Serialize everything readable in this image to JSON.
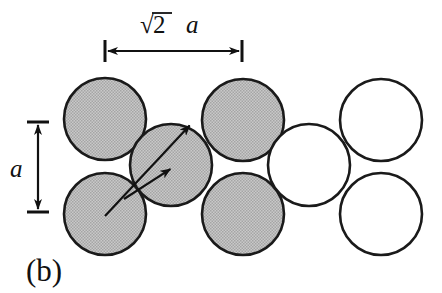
{
  "figure": {
    "panel_label": "(b)",
    "width": 442,
    "height": 293,
    "background_color": "#ffffff",
    "line_color": "#1a1a1a",
    "shaded_fill_color": "#b9b9b9",
    "open_fill_color": "#ffffff"
  },
  "annotations": {
    "horizontal_dimension": {
      "radical_symbol": "√",
      "radicand": "2",
      "variable": "a",
      "full_label": "√2 a",
      "x_start": 105,
      "x_end": 242,
      "y": 51
    },
    "vertical_dimension": {
      "label": "a",
      "y_start": 122,
      "y_end": 212,
      "x": 38
    }
  },
  "chart_data": {
    "type": "scatter",
    "title": "(b)",
    "xlabel": "",
    "ylabel": "",
    "sphere_radius": 41,
    "row_spacing": 95,
    "column_spacing": 138,
    "legend": [
      {
        "name": "shaded-sphere",
        "fill": "#b9b9b9"
      },
      {
        "name": "open-sphere",
        "fill": "#ffffff"
      }
    ],
    "spheres": [
      {
        "id": "top-left-shaded",
        "cx": 105,
        "cy": 119,
        "r": 41,
        "style": "shaded",
        "row": "top",
        "column": 1
      },
      {
        "id": "bottom-left-shaded",
        "cx": 105,
        "cy": 214,
        "r": 41,
        "style": "shaded",
        "row": "bottom",
        "column": 1
      },
      {
        "id": "middle-stagger-shaded",
        "cx": 171,
        "cy": 165,
        "r": 41,
        "style": "shaded",
        "row": "middle",
        "column": 2
      },
      {
        "id": "top-mid-shaded",
        "cx": 243,
        "cy": 120,
        "r": 41,
        "style": "shaded",
        "row": "top",
        "column": 3
      },
      {
        "id": "bottom-mid-shaded",
        "cx": 243,
        "cy": 214,
        "r": 41,
        "style": "shaded",
        "row": "bottom",
        "column": 3
      },
      {
        "id": "middle-stagger-open",
        "cx": 309,
        "cy": 165,
        "r": 41,
        "style": "open",
        "row": "middle",
        "column": 4
      },
      {
        "id": "top-right-open",
        "cx": 381,
        "cy": 120,
        "r": 41,
        "style": "open",
        "row": "top",
        "column": 5
      },
      {
        "id": "bottom-right-open",
        "cx": 381,
        "cy": 214,
        "r": 41,
        "style": "open",
        "row": "bottom",
        "column": 5
      }
    ],
    "vectors": [
      {
        "id": "long-direction-arrow",
        "x1": 105,
        "y1": 216,
        "x2": 191,
        "y2": 124
      },
      {
        "id": "short-direction-arrow",
        "x1": 124,
        "y1": 199,
        "x2": 172,
        "y2": 168
      }
    ]
  }
}
